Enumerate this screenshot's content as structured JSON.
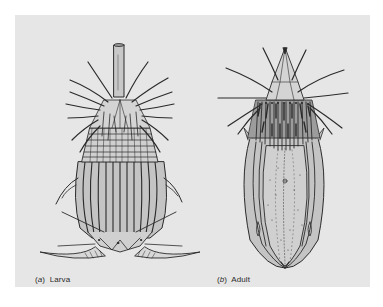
{
  "figure": {
    "panels": [
      {
        "id": "a",
        "letter": "a",
        "label": "Larva"
      },
      {
        "id": "b",
        "letter": "b",
        "label": "Adult"
      }
    ],
    "colors": {
      "page_background": "#ffffff",
      "panel_background": "#e6e6e6",
      "body_fill": "#c4c4c4",
      "line": "#2a2a2a"
    }
  }
}
